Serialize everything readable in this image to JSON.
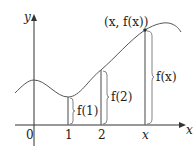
{
  "diagram": {
    "axes": {
      "x_label": "x",
      "y_label": "y"
    },
    "ticks": [
      {
        "label": "0",
        "x": 29
      },
      {
        "label": "1",
        "x": 68
      },
      {
        "label": "2",
        "x": 101
      },
      {
        "label": "x",
        "x": 145
      }
    ],
    "point_label": "(x, f(x))",
    "braces": [
      {
        "label": "f(1)"
      },
      {
        "label": "f(2)"
      },
      {
        "label": "f(x)"
      }
    ],
    "colors": {
      "line": "#444444",
      "accent": "#8a8a8a"
    }
  }
}
